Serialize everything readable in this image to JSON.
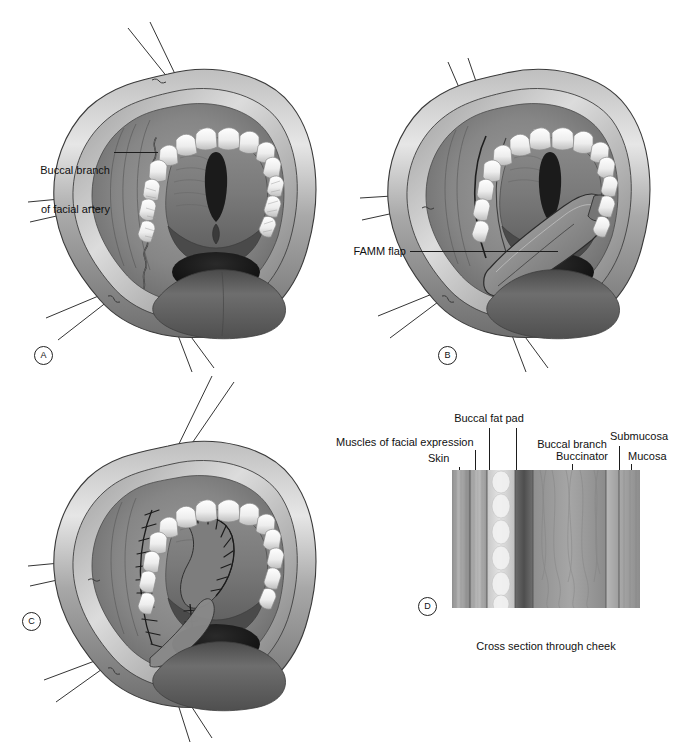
{
  "figure": {
    "panels": [
      {
        "id": "A",
        "marker": "A",
        "label": "Buccal branch\nof facial artery"
      },
      {
        "id": "B",
        "marker": "B",
        "label": "FAMM flap"
      },
      {
        "id": "C",
        "marker": "C",
        "label": ""
      },
      {
        "id": "D",
        "marker": "D",
        "caption": "Cross section through cheek"
      }
    ]
  },
  "panel_a": {
    "marker": "A",
    "callout": "Buccal branch\nof facial artery",
    "callout_line1": "Buccal branch",
    "callout_line2": "of facial artery"
  },
  "panel_b": {
    "marker": "B",
    "callout": "FAMM flap"
  },
  "panel_c": {
    "marker": "C"
  },
  "panel_d": {
    "marker": "D",
    "caption": "Cross section through cheek",
    "layers": [
      {
        "name": "Skin",
        "label": "Skin"
      },
      {
        "name": "Muscles of facial expression",
        "label": "Muscles of facial expression"
      },
      {
        "name": "Buccal fat pad",
        "label": "Buccal fat pad"
      },
      {
        "name": "Buccal branch of facial artery",
        "label": "Buccal branch\nof facial artery",
        "label_line1": "Buccal branch",
        "label_line2": "of facial artery"
      },
      {
        "name": "Buccinator",
        "label": "Buccinator"
      },
      {
        "name": "Submucosa",
        "label": "Submucosa"
      },
      {
        "name": "Mucosa",
        "label": "Mucosa"
      }
    ],
    "label_skin": "Skin",
    "label_muscles": "Muscles of facial expression",
    "label_fatpad": "Buccal fat pad",
    "label_artery_1": "Buccal branch",
    "label_artery_2": "of facial artery",
    "label_buccinator": "Buccinator",
    "label_submucosa": "Submucosa",
    "label_mucosa": "Mucosa"
  },
  "colors": {
    "ink": "#1d1d1d",
    "background": "#ffffff",
    "lip_light": "#d8d8d8",
    "lip_mid": "#9a9a9a",
    "lip_dark": "#5e5e5e",
    "mucosa_mid": "#8e8e8e",
    "cavity_dark": "#3c3c3c",
    "cavity_black": "#141414",
    "tooth": "#f2f2f2",
    "tongue": "#6a6a6a"
  }
}
